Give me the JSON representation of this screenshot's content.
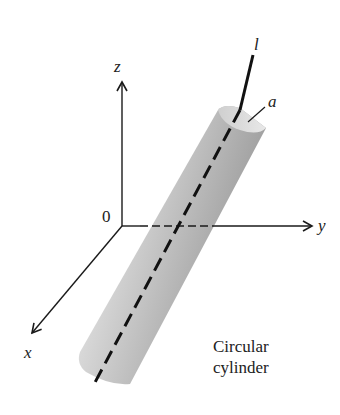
{
  "figure": {
    "labels": {
      "z_axis": "z",
      "y_axis": "y",
      "x_axis": "x",
      "origin": "0",
      "line": "l",
      "radius": "a"
    },
    "caption": {
      "line1": "Circular",
      "line2": "cylinder"
    },
    "colors": {
      "axis": "#1a1a1a",
      "line_l": "#111111",
      "cylinder_light": "#e6e6e6",
      "cylinder_mid": "#b8b8b8",
      "cylinder_dark": "#8c8c8c"
    }
  }
}
